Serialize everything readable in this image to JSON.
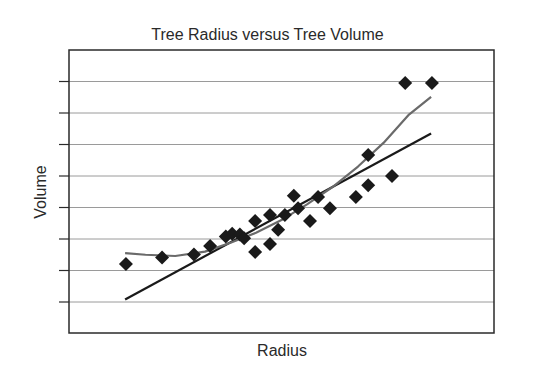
{
  "chart_data": {
    "type": "scatter",
    "title": "Tree Radius versus Tree Volume",
    "xlabel": "Radius",
    "ylabel": "Volume",
    "x_tick_labels": [],
    "y_tick_labels": [],
    "y_ticks_count": 8,
    "grid": "horizontal",
    "legend": "none",
    "xlim": [
      0,
      10
    ],
    "ylim": [
      0,
      9
    ],
    "series": [
      {
        "name": "data",
        "marker": "diamond",
        "color": "#1a1a1a",
        "points": [
          [
            1.34,
            2.21
          ],
          [
            2.19,
            2.41
          ],
          [
            2.94,
            2.51
          ],
          [
            3.32,
            2.78
          ],
          [
            3.69,
            3.08
          ],
          [
            3.84,
            3.17
          ],
          [
            4.02,
            3.14
          ],
          [
            4.12,
            3.02
          ],
          [
            4.38,
            3.57
          ],
          [
            4.38,
            2.59
          ],
          [
            4.73,
            2.84
          ],
          [
            4.73,
            3.76
          ],
          [
            4.92,
            3.29
          ],
          [
            5.08,
            3.76
          ],
          [
            5.29,
            4.37
          ],
          [
            5.39,
            3.98
          ],
          [
            5.67,
            3.57
          ],
          [
            5.86,
            4.33
          ],
          [
            6.14,
            3.98
          ],
          [
            6.75,
            4.33
          ],
          [
            7.04,
            5.67
          ],
          [
            7.04,
            4.71
          ],
          [
            7.6,
            5.0
          ],
          [
            7.91,
            7.95
          ],
          [
            8.54,
            7.95
          ]
        ]
      },
      {
        "name": "linear fit",
        "type": "line",
        "color": "#1a1a1a",
        "points": [
          [
            1.32,
            1.08
          ],
          [
            8.52,
            6.35
          ]
        ]
      },
      {
        "name": "curve fit",
        "type": "line",
        "color": "#6a6a6a",
        "points": [
          [
            1.32,
            2.55
          ],
          [
            1.8,
            2.5
          ],
          [
            2.5,
            2.46
          ],
          [
            3.2,
            2.6
          ],
          [
            3.8,
            2.88
          ],
          [
            4.4,
            3.2
          ],
          [
            5.0,
            3.6
          ],
          [
            5.6,
            4.1
          ],
          [
            6.2,
            4.65
          ],
          [
            6.8,
            5.3
          ],
          [
            7.4,
            6.05
          ],
          [
            8.0,
            6.95
          ],
          [
            8.52,
            7.51
          ]
        ]
      }
    ]
  }
}
